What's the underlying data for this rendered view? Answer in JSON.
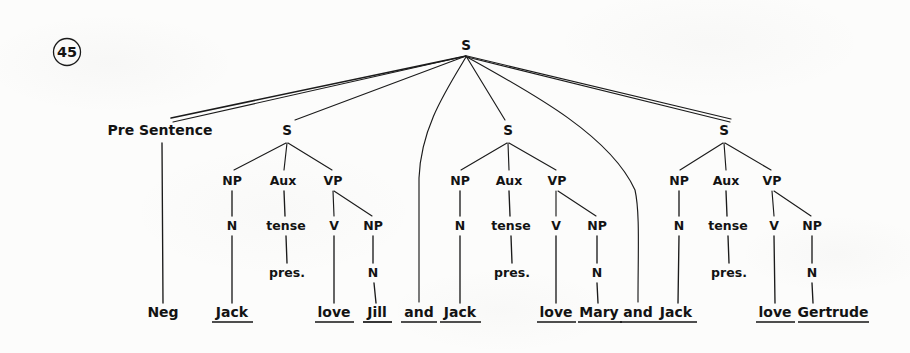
{
  "figure": {
    "example_number": "45",
    "type": "syntax-tree"
  },
  "root": {
    "label": "S",
    "x": 466,
    "y": 46
  },
  "pre_sentence": {
    "label": "Pre Sentence",
    "x": 160,
    "y": 131,
    "child": {
      "label": "Neg",
      "x": 163,
      "y": 313,
      "underlined": false
    }
  },
  "conjunctions": [
    {
      "label": "and",
      "x": 419,
      "y": 313,
      "underlined": true
    },
    {
      "label": "and",
      "x": 638,
      "y": 313,
      "underlined": true
    }
  ],
  "clauses": [
    {
      "name": "clause-1",
      "root_label": "S",
      "root_x": 287,
      "root_y": 131,
      "nodes": {
        "np": {
          "label": "NP",
          "x": 232,
          "y": 181
        },
        "aux": {
          "label": "Aux",
          "x": 283,
          "y": 181
        },
        "vp": {
          "label": "VP",
          "x": 333,
          "y": 181
        },
        "n_subject": {
          "label": "N",
          "x": 232,
          "y": 226
        },
        "tense": {
          "label": "tense",
          "x": 286,
          "y": 226
        },
        "v": {
          "label": "V",
          "x": 334,
          "y": 226
        },
        "np_object": {
          "label": "NP",
          "x": 373,
          "y": 226
        },
        "pres": {
          "label": "pres.",
          "x": 287,
          "y": 273
        },
        "n_object": {
          "label": "N",
          "x": 373,
          "y": 273
        }
      },
      "terminals": [
        {
          "label": "Jack",
          "x": 232,
          "y": 313,
          "underlined": true
        },
        {
          "label": "love",
          "x": 334,
          "y": 313,
          "underlined": true
        },
        {
          "label": "Jill",
          "x": 377,
          "y": 313,
          "underlined": true
        }
      ]
    },
    {
      "name": "clause-2",
      "root_label": "S",
      "root_x": 508,
      "root_y": 131,
      "nodes": {
        "np": {
          "label": "NP",
          "x": 460,
          "y": 181
        },
        "aux": {
          "label": "Aux",
          "x": 509,
          "y": 181
        },
        "vp": {
          "label": "VP",
          "x": 557,
          "y": 181
        },
        "n_subject": {
          "label": "N",
          "x": 460,
          "y": 226
        },
        "tense": {
          "label": "tense",
          "x": 511,
          "y": 226
        },
        "v": {
          "label": "V",
          "x": 556,
          "y": 226
        },
        "np_object": {
          "label": "NP",
          "x": 597,
          "y": 226
        },
        "pres": {
          "label": "pres.",
          "x": 512,
          "y": 273
        },
        "n_object": {
          "label": "N",
          "x": 597,
          "y": 273
        }
      },
      "terminals": [
        {
          "label": "Jack",
          "x": 460,
          "y": 313,
          "underlined": true
        },
        {
          "label": "love",
          "x": 556,
          "y": 313,
          "underlined": true
        },
        {
          "label": "Mary",
          "x": 599,
          "y": 313,
          "underlined": true
        }
      ]
    },
    {
      "name": "clause-3",
      "root_label": "S",
      "root_x": 724,
      "root_y": 131,
      "nodes": {
        "np": {
          "label": "NP",
          "x": 679,
          "y": 181
        },
        "aux": {
          "label": "Aux",
          "x": 726,
          "y": 181
        },
        "vp": {
          "label": "VP",
          "x": 772,
          "y": 181
        },
        "n_subject": {
          "label": "N",
          "x": 679,
          "y": 226
        },
        "tense": {
          "label": "tense",
          "x": 728,
          "y": 226
        },
        "v": {
          "label": "V",
          "x": 774,
          "y": 226
        },
        "np_object": {
          "label": "NP",
          "x": 812,
          "y": 226
        },
        "pres": {
          "label": "pres.",
          "x": 729,
          "y": 273
        },
        "n_object": {
          "label": "N",
          "x": 812,
          "y": 273
        }
      },
      "terminals": [
        {
          "label": "Jack",
          "x": 676,
          "y": 313,
          "underlined": true
        },
        {
          "label": "love",
          "x": 774,
          "y": 313,
          "underlined": true
        },
        {
          "label": "Gertrude",
          "x": 833,
          "y": 313,
          "underlined": true
        }
      ]
    }
  ],
  "colors": {
    "ink": "#131313",
    "paper": "#fcfcfb",
    "line": "#1b1b1b"
  }
}
